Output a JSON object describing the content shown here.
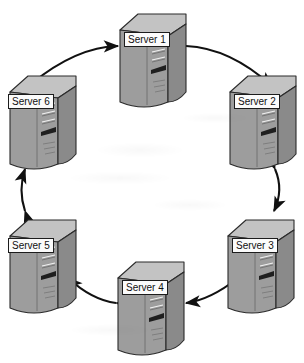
{
  "diagram": {
    "type": "ring-topology",
    "background_color": "#ffffff",
    "node_icon": "server-tower-icon",
    "link_icon": "double-headed-arrow-icon",
    "colors": {
      "server_front": "#a8a8a8",
      "server_side": "#8c8c8c",
      "server_top": "#c3c3c3",
      "outline": "#2b2b2b",
      "arrow": "#111111",
      "label_bg": "#fbfbfb",
      "label_text": "#111111"
    },
    "nodes": [
      {
        "id": "server-1",
        "label": "Server 1",
        "x": 116,
        "y": 10,
        "label_x": 8,
        "label_y": 22
      },
      {
        "id": "server-2",
        "label": "Server 2",
        "x": 226,
        "y": 72,
        "label_x": 8,
        "label_y": 22
      },
      {
        "id": "server-3",
        "label": "Server 3",
        "x": 224,
        "y": 216,
        "label_x": 8,
        "label_y": 22
      },
      {
        "id": "server-4",
        "label": "Server 4",
        "x": 114,
        "y": 258,
        "label_x": 8,
        "label_y": 22
      },
      {
        "id": "server-5",
        "label": "Server 5",
        "x": 6,
        "y": 216,
        "label_x": 2,
        "label_y": 22
      },
      {
        "id": "server-6",
        "label": "Server 6",
        "x": 6,
        "y": 72,
        "label_x": 2,
        "label_y": 22
      }
    ],
    "links": [
      {
        "id": "link-6-1",
        "from": "server-6",
        "to": "server-1",
        "bidirectional": true
      },
      {
        "id": "link-1-2",
        "from": "server-1",
        "to": "server-2",
        "bidirectional": true
      },
      {
        "id": "link-2-3",
        "from": "server-2",
        "to": "server-3",
        "bidirectional": true
      },
      {
        "id": "link-3-4",
        "from": "server-3",
        "to": "server-4",
        "bidirectional": true
      },
      {
        "id": "link-4-5",
        "from": "server-4",
        "to": "server-5",
        "bidirectional": true
      },
      {
        "id": "link-5-6",
        "from": "server-5",
        "to": "server-6",
        "bidirectional": true
      }
    ]
  }
}
